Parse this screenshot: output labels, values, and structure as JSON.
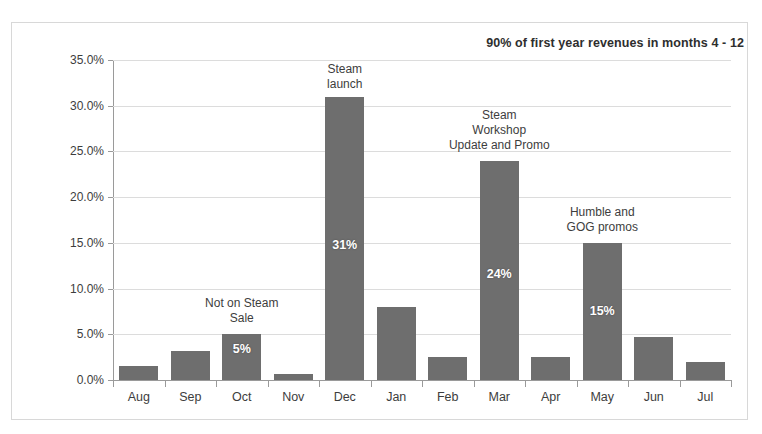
{
  "chart_data": {
    "type": "bar",
    "title": "90% of first year revenues in months 4 - 12",
    "xlabel": "",
    "ylabel": "% of First Year Revenues",
    "ylim": [
      0,
      35
    ],
    "ytick_labels": [
      "0.0%",
      "5.0%",
      "10.0%",
      "15.0%",
      "20.0%",
      "25.0%",
      "30.0%",
      "35.0%"
    ],
    "ytick_values": [
      0,
      5,
      10,
      15,
      20,
      25,
      30,
      35
    ],
    "grid": true,
    "legend": "none",
    "categories": [
      "Aug",
      "Sep",
      "Oct",
      "Nov",
      "Dec",
      "Jan",
      "Feb",
      "Mar",
      "Apr",
      "May",
      "Jun",
      "Jul"
    ],
    "values": [
      1.5,
      3.2,
      5.0,
      0.7,
      31.0,
      8.0,
      2.5,
      24.0,
      2.5,
      15.0,
      4.7,
      2.0
    ],
    "bar_labels": [
      {
        "category": "Oct",
        "text": "5%"
      },
      {
        "category": "Dec",
        "text": "31%"
      },
      {
        "category": "Mar",
        "text": "24%"
      },
      {
        "category": "May",
        "text": "15%"
      }
    ],
    "annotations": [
      {
        "category": "Oct",
        "text": "Not on Steam\nSale",
        "lines": [
          "Not on Steam",
          "Sale"
        ]
      },
      {
        "category": "Dec",
        "text": "Steam\nlaunch",
        "lines": [
          "Steam",
          "launch"
        ]
      },
      {
        "category": "Mar",
        "text": "Steam\nWorkshop\nUpdate and Promo",
        "lines": [
          "Steam",
          "Workshop",
          "Update and Promo"
        ]
      },
      {
        "category": "May",
        "text": "Humble and\nGOG promos",
        "lines": [
          "Humble and",
          "GOG promos"
        ]
      }
    ],
    "colors": {
      "bar": "#6e6e6e",
      "grid": "#dcdcdc",
      "axis": "#9a9a9a",
      "text": "#3d3d3d",
      "bar_label_text": "#ffffff",
      "background": "#ffffff"
    }
  }
}
